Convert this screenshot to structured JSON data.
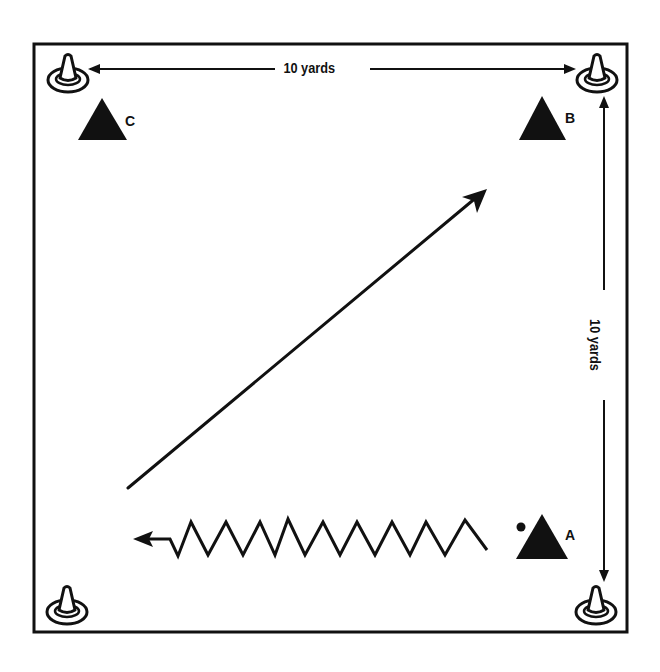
{
  "diagram": {
    "type": "soccer drill field layout",
    "field": {
      "shape": "square",
      "border_color": "#111111",
      "background": "#ffffff"
    },
    "dimensions": {
      "top": "10 yards",
      "right": "10 yards"
    },
    "cones": [
      {
        "id": "cone-top-left",
        "position": "top-left"
      },
      {
        "id": "cone-top-right",
        "position": "top-right"
      },
      {
        "id": "cone-bottom-left",
        "position": "bottom-left"
      },
      {
        "id": "cone-bottom-right",
        "position": "bottom-right"
      }
    ],
    "players": [
      {
        "label": "C",
        "position": "top-left",
        "has_ball": false
      },
      {
        "label": "B",
        "position": "top-right",
        "has_ball": false
      },
      {
        "label": "A",
        "position": "bottom-right",
        "has_ball": true
      }
    ],
    "paths": [
      {
        "type": "dribble",
        "style": "zigzag",
        "from": "A",
        "direction": "left"
      },
      {
        "type": "pass",
        "style": "straight-arrow",
        "direction": "diagonal up-right toward B"
      }
    ],
    "ink_color": "#111111"
  }
}
